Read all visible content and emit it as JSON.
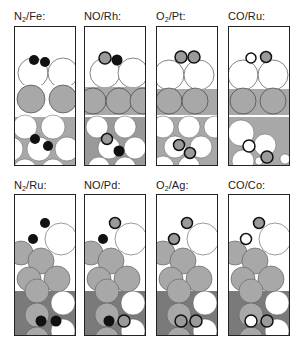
{
  "colors": {
    "metal_white": "#ffffff",
    "metal_gray": "#a8a8a8",
    "dark_gray": "#7a7a7a",
    "black": "#111111",
    "adsorbate_gray": "#9a9a9a",
    "outline": "#222222"
  },
  "panels": [
    {
      "id": "n2-fe",
      "label_pre": "N",
      "label_sub": "2",
      "label_post": "/Fe:",
      "adsorbate": "N2",
      "surface": "Fe"
    },
    {
      "id": "no-rh",
      "label_pre": "NO/Rh:",
      "label_sub": "",
      "label_post": "",
      "adsorbate": "NO",
      "surface": "Rh"
    },
    {
      "id": "o2-pt",
      "label_pre": "O",
      "label_sub": "2",
      "label_post": "/Pt:",
      "adsorbate": "O2",
      "surface": "Pt"
    },
    {
      "id": "co-ru",
      "label_pre": "CO/Ru:",
      "label_sub": "",
      "label_post": "",
      "adsorbate": "CO",
      "surface": "Ru"
    },
    {
      "id": "n2-ru",
      "label_pre": "N",
      "label_sub": "2",
      "label_post": "/Ru:",
      "adsorbate": "N2",
      "surface": "Ru"
    },
    {
      "id": "no-pd",
      "label_pre": "NO/Pd:",
      "label_sub": "",
      "label_post": "",
      "adsorbate": "NO",
      "surface": "Pd"
    },
    {
      "id": "o2-ag",
      "label_pre": "O",
      "label_sub": "2",
      "label_post": "/Ag:",
      "adsorbate": "O2",
      "surface": "Ag"
    },
    {
      "id": "co-co",
      "label_pre": "CO/Co:",
      "label_sub": "",
      "label_post": "",
      "adsorbate": "CO",
      "surface": "Co"
    }
  ]
}
